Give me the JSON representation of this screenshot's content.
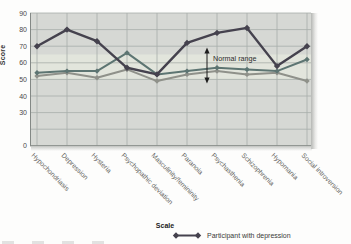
{
  "figure": {
    "ylabel": "Score",
    "xlabel": "Scale"
  },
  "chart_data": {
    "type": "line",
    "title": "",
    "xlabel": "Scale",
    "ylabel": "Score",
    "categories": [
      "Hypochondriasis",
      "Depression",
      "Hysteria",
      "Psychopathic deviation",
      "Masculinity/femininity",
      "Paranoia",
      "Psychasthenia",
      "Schizophrenia",
      "Hypomania",
      "Social introversion"
    ],
    "ylim": [
      0,
      90
    ],
    "yticks": [
      90,
      80,
      70,
      60,
      50,
      40,
      30,
      null,
      0
    ],
    "broken_axis_below": 30,
    "grid": true,
    "normal_range": {
      "from": 50,
      "to": 65,
      "label": "Normal range"
    },
    "legend_position": "bottom",
    "series": [
      {
        "name": "Participant with depression",
        "in_legend": true,
        "color": "#45424e",
        "marker": "diamond",
        "values": [
          70,
          80,
          73,
          57,
          53,
          72,
          78,
          81,
          58,
          70
        ]
      },
      {
        "name": "",
        "in_legend": false,
        "color": "#5d7572",
        "marker": "diamond",
        "values": [
          54,
          55,
          55,
          66,
          53,
          55,
          57,
          56,
          55,
          62
        ]
      },
      {
        "name": "",
        "in_legend": false,
        "color": "#8f918a",
        "marker": "diamond",
        "values": [
          52,
          54,
          51,
          56,
          49,
          53,
          55,
          53,
          54,
          49
        ]
      }
    ]
  },
  "colors": {
    "plot_bg": "#d6d8d4",
    "band": "#e2e5dc",
    "gridline": "#a7adaa",
    "axis": "#838885",
    "tick_text": "#4a4a4a",
    "category_text": "#666662",
    "annotation": "#1d1d1d"
  }
}
